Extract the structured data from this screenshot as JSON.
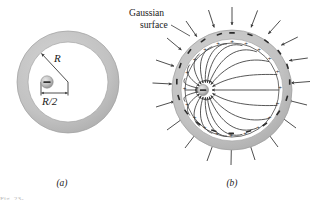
{
  "figure": {
    "background_color": "#ffffff",
    "shell_fill": "#c2c2c2",
    "shell_stroke": "#9a9a9a",
    "line_color": "#3a3a3a",
    "text_color": "#1a1a1a",
    "cavity_fill": "#ffffff"
  },
  "panel_a": {
    "caption": "(a)",
    "center": {
      "x": 68,
      "y": 82
    },
    "outer_radius": 51,
    "inner_radius": 40,
    "radius_label": "R",
    "radius_label_pos": {
      "x": 57,
      "y": 56
    },
    "radius_arrow": {
      "from_x": 68,
      "to_x": 40,
      "from_y": 82,
      "to_y": 53
    },
    "offset_label": "R/2",
    "offset_label_pos": {
      "x": 49,
      "y": 104
    },
    "charge": {
      "sign": "−",
      "center": {
        "x": 47,
        "y": 82
      },
      "radius": 6.2,
      "fill": "#b9b9b9"
    },
    "dimension_line": {
      "y": 94,
      "x1": 34,
      "x2": 68
    }
  },
  "panel_b": {
    "caption": "(b)",
    "center": {
      "x": 232,
      "y": 90
    },
    "outer_radius": 60,
    "inner_radius": 51,
    "gaussian_radius": 47,
    "charge": {
      "sign": "−",
      "center": {
        "x": 203,
        "y": 90
      },
      "radius": 5.5,
      "fill": "#b9b9b9"
    },
    "annotation": {
      "line1": "Gaussian",
      "line2": "surface",
      "line1_pos": {
        "x": 129,
        "y": 16
      },
      "line2_pos": {
        "x": 140,
        "y": 28
      },
      "leader": {
        "x1": 168,
        "y1": 26,
        "x2": 186,
        "y2": 37
      }
    },
    "inner_surface_sign": "+",
    "outer_surface_sign": "−",
    "field_line_count": 22,
    "external_arrow_count": 20,
    "field_direction": "inward"
  },
  "bottom_strip_text": "Fig. 23-"
}
